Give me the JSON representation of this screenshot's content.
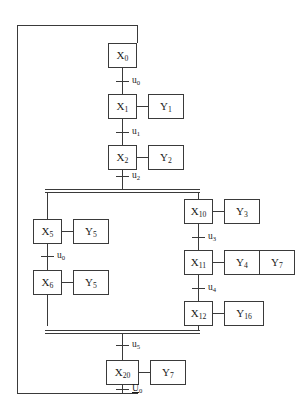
{
  "diagram": {
    "type": "grafcet-sfc",
    "line_color": "#3a3a3a",
    "text_color": "#1a1a1a",
    "background": "#ffffff"
  },
  "steps": {
    "x0": {
      "label": "X",
      "index": "0"
    },
    "x1": {
      "label": "X",
      "index": "1"
    },
    "x2": {
      "label": "X",
      "index": "2"
    },
    "x5": {
      "label": "X",
      "index": "5"
    },
    "x6": {
      "label": "X",
      "index": "6"
    },
    "x10": {
      "label": "X",
      "index": "10"
    },
    "x11": {
      "label": "X",
      "index": "11"
    },
    "x12": {
      "label": "X",
      "index": "12"
    },
    "x20": {
      "label": "X",
      "index": "20"
    }
  },
  "actions": {
    "y1": {
      "label": "Y",
      "index": "1"
    },
    "y2": {
      "label": "Y",
      "index": "2"
    },
    "y3": {
      "label": "Y",
      "index": "3"
    },
    "y4": {
      "label": "Y",
      "index": "4"
    },
    "y7a": {
      "label": "Y",
      "index": "7"
    },
    "y5a": {
      "label": "Y",
      "index": "5"
    },
    "y5b": {
      "label": "Y",
      "index": "5"
    },
    "y16": {
      "label": "Y",
      "index": "16"
    },
    "y7b": {
      "label": "Y",
      "index": "7"
    }
  },
  "transitions": {
    "t0": {
      "label": "u",
      "index": "0",
      "underlined": false
    },
    "t1": {
      "label": "u",
      "index": "1",
      "underlined": false
    },
    "t2": {
      "label": "u",
      "index": "2",
      "underlined": false
    },
    "t3": {
      "label": "u",
      "index": "3",
      "underlined": false
    },
    "t4": {
      "label": "u",
      "index": "4",
      "underlined": false
    },
    "t5": {
      "label": "u",
      "index": "5",
      "underlined": false
    },
    "t_left": {
      "label": "u",
      "index": "0",
      "underlined": false
    },
    "t_reset": {
      "label": "U",
      "index": "0",
      "underlined": true
    }
  }
}
